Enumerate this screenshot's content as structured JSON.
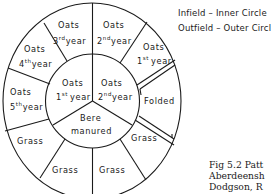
{
  "legend": {
    "infield": "Infield – Inner Circle",
    "outfield": "Outfield – Outer Circle"
  },
  "inner_circle": {
    "segments": [
      {
        "crop": "Oats",
        "ordinal": "1",
        "suffix": "st",
        "unit": "year"
      },
      {
        "crop": "Oats",
        "ordinal": "2",
        "suffix": "nd",
        "unit": "year"
      },
      {
        "crop": "Bere",
        "note": "manured"
      }
    ]
  },
  "outer_circle": {
    "segments": [
      {
        "crop": "Oats",
        "ordinal": "3",
        "suffix": "rd",
        "unit": "year"
      },
      {
        "crop": "Oats",
        "ordinal": "2",
        "suffix": "nd",
        "unit": "year"
      },
      {
        "crop": "Oats",
        "ordinal": "1",
        "suffix": "st",
        "unit": "year"
      },
      {
        "crop": "Folded"
      },
      {
        "crop": "Grass"
      },
      {
        "crop": "Grass"
      },
      {
        "crop": "Grass"
      },
      {
        "crop": "Grass"
      },
      {
        "crop": "Oats",
        "ordinal": "5",
        "suffix": "th",
        "unit": "year"
      },
      {
        "crop": "Oats",
        "ordinal": "4",
        "suffix": "th",
        "unit": "year"
      }
    ]
  },
  "caption": {
    "lines": [
      "Fig 5.2 Patt",
      "Aberdeensh",
      "Dodgson, R",
      "Tr  I  t B"
    ]
  },
  "colors": {
    "ink": "#1a1a1a",
    "paper": "#ffffff"
  }
}
